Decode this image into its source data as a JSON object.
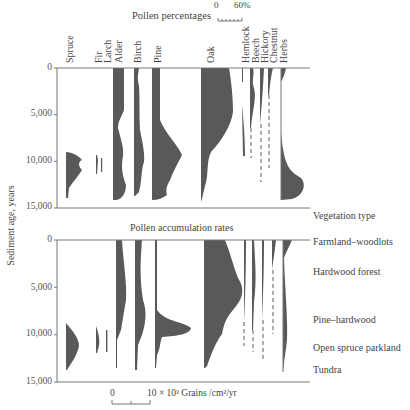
{
  "chart_data": [
    {
      "type": "area",
      "title": "Pollen percentages",
      "scale_bar": {
        "min_label": "0",
        "max_label": "60%"
      },
      "ylabel": "Sediment age, years",
      "yticks": [
        "0",
        "5,000",
        "10,000",
        "15,000"
      ],
      "ylim": [
        0,
        15000
      ],
      "taxa": [
        "Spruce",
        "Fir",
        "Larch",
        "Alder",
        "Birch",
        "Pine",
        "Oak",
        "Hemlock",
        "Beech",
        "Hickory",
        "Chestnut",
        "Herbs"
      ],
      "series": [
        {
          "name": "Spruce",
          "age": [
            9000,
            9500,
            10000,
            10500,
            11000,
            12000,
            13000,
            14000
          ],
          "value": [
            15,
            15,
            8,
            14,
            8,
            12,
            4,
            1
          ]
        },
        {
          "name": "Fir",
          "age": [
            9500,
            10500,
            11500
          ],
          "value": [
            1,
            3,
            1
          ]
        },
        {
          "name": "Larch",
          "age": [
            9500,
            11500
          ],
          "value": [
            1,
            1
          ]
        },
        {
          "name": "Alder",
          "age": [
            0,
            4000,
            6000,
            8000,
            10000,
            12000,
            13000,
            14000
          ],
          "value": [
            7,
            7,
            5,
            12,
            8,
            12,
            7,
            3
          ]
        },
        {
          "name": "Birch",
          "age": [
            0,
            2000,
            4000,
            8000,
            10000,
            12000,
            13500
          ],
          "value": [
            4,
            3,
            4,
            6,
            9,
            7,
            2
          ]
        },
        {
          "name": "Pine",
          "age": [
            0,
            5000,
            7000,
            9000,
            10000,
            11500,
            13000,
            14000
          ],
          "value": [
            6,
            6,
            14,
            23,
            15,
            10,
            12,
            8
          ]
        },
        {
          "name": "Oak",
          "age": [
            0,
            3000,
            6000,
            8000,
            9000,
            10500,
            12000,
            14000
          ],
          "value": [
            20,
            26,
            24,
            13,
            5,
            4,
            3,
            1
          ]
        },
        {
          "name": "Hemlock",
          "age": [
            0,
            1000,
            3000,
            5000,
            7000,
            9000
          ],
          "value": [
            1,
            0,
            1,
            3,
            2,
            1
          ]
        },
        {
          "name": "Beech",
          "age": [
            0,
            2000,
            4000,
            6000,
            7000,
            9500
          ],
          "value": [
            3,
            4,
            4,
            2,
            0.5,
            0.5
          ]
        },
        {
          "name": "Hickory",
          "age": [
            0,
            3000,
            5500,
            12000
          ],
          "value": [
            3,
            3,
            1,
            0.5
          ]
        },
        {
          "name": "Chestnut",
          "age": [
            0,
            2000,
            5000,
            11000
          ],
          "value": [
            3,
            1,
            0.5,
            0.5
          ]
        },
        {
          "name": "Herbs",
          "age": [
            0,
            1000,
            6000,
            10000,
            12000,
            13000,
            14000
          ],
          "value": [
            4,
            1,
            0.5,
            1,
            8,
            18,
            15
          ]
        }
      ]
    },
    {
      "type": "area",
      "title": "Pollen accumulation rates",
      "scale_bar": {
        "min_label": "0",
        "max_label": "10 × 10³ Grains /cm²/yr"
      },
      "ylabel": "Sediment age, years",
      "yticks": [
        "0",
        "5,000",
        "10,000",
        "15,000"
      ],
      "ylim": [
        0,
        15000
      ],
      "series": [
        {
          "name": "Spruce",
          "age": [
            8500,
            10000,
            11000,
            12500
          ],
          "value": [
            1,
            4,
            3,
            0.5
          ]
        },
        {
          "name": "Fir",
          "age": [
            9500,
            10500,
            11500
          ],
          "value": [
            0.5,
            1.5,
            0.5
          ]
        },
        {
          "name": "Larch",
          "age": [
            9500,
            11500
          ],
          "value": [
            0.5,
            0.5
          ]
        },
        {
          "name": "Alder",
          "age": [
            0,
            3000,
            6000,
            8500,
            10000,
            13500
          ],
          "value": [
            2,
            3,
            4,
            3,
            1,
            0.3
          ]
        },
        {
          "name": "Birch",
          "age": [
            0,
            5000,
            8000,
            9000,
            10000,
            13500
          ],
          "value": [
            2,
            2,
            4,
            3,
            1,
            0.3
          ]
        },
        {
          "name": "Pine",
          "age": [
            0,
            7000,
            8500,
            9000,
            10000,
            11000,
            13500
          ],
          "value": [
            1,
            1,
            12,
            8,
            2,
            1,
            0.3
          ]
        },
        {
          "name": "Oak",
          "age": [
            0,
            2000,
            4000,
            5000,
            7000,
            8500,
            10000,
            12000,
            13500
          ],
          "value": [
            6,
            10,
            14,
            11,
            7,
            6,
            3,
            1,
            0.3
          ]
        },
        {
          "name": "Hemlock",
          "age": [
            0,
            5000,
            10500
          ],
          "value": [
            1,
            1,
            0.3
          ]
        },
        {
          "name": "Beech",
          "age": [
            0,
            4000,
            6000,
            11000
          ],
          "value": [
            1,
            3,
            1,
            0.3
          ]
        },
        {
          "name": "Hickory",
          "age": [
            0,
            4000,
            12000
          ],
          "value": [
            1,
            1,
            0.3
          ]
        },
        {
          "name": "Chestnut",
          "age": [
            0,
            1000,
            9000
          ],
          "value": [
            2,
            1,
            0.3
          ]
        },
        {
          "name": "Herbs",
          "age": [
            0,
            1000,
            8000,
            10000,
            13500
          ],
          "value": [
            3,
            1,
            1,
            1,
            0.3
          ]
        }
      ]
    }
  ],
  "top_panel": {
    "title": "Pollen percentages",
    "scale_min": "0",
    "scale_max": "60%"
  },
  "bottom_panel": {
    "title": "Pollen accumulation rates",
    "scale_min": "0",
    "scale_label": "10 × 10³ Grains /cm²/yr"
  },
  "y_axis": {
    "label": "Sediment age, years",
    "ticks": [
      "0",
      "5,000",
      "10,000",
      "15,000"
    ]
  },
  "taxa_labels": [
    "Spruce",
    "Fir",
    "Larch",
    "Alder",
    "Birch",
    "Pine",
    "Oak",
    "Hemlock",
    "Beech",
    "Hickory",
    "Chestnut",
    "Herbs"
  ],
  "vegetation": {
    "heading": "Vegetation type",
    "zones": [
      "Farmland–woodlots",
      "Hardwood forest",
      "Pine–hardwood",
      "Open spruce parkland",
      "Tundra"
    ]
  }
}
